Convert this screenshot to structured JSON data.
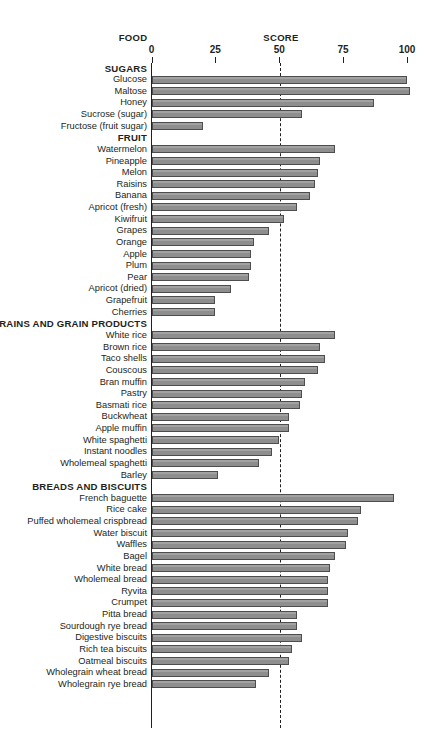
{
  "header": {
    "food": "FOOD",
    "score": "SCORE"
  },
  "axis": {
    "ticks": [
      0,
      25,
      50,
      75,
      100
    ],
    "reference_line": 50
  },
  "chart_data": {
    "type": "bar",
    "title": "",
    "xlabel": "SCORE",
    "ylabel": "FOOD",
    "orientation": "horizontal",
    "xlim": [
      0,
      100
    ],
    "grid": false,
    "reference_line": 50,
    "sections": [
      {
        "name": "SUGARS",
        "items": [
          {
            "label": "Glucose",
            "value": 100
          },
          {
            "label": "Maltose",
            "value": 101
          },
          {
            "label": "Honey",
            "value": 87
          },
          {
            "label": "Sucrose (sugar)",
            "value": 59
          },
          {
            "label": "Fructose (fruit sugar)",
            "value": 20
          }
        ]
      },
      {
        "name": "FRUIT",
        "items": [
          {
            "label": "Watermelon",
            "value": 72
          },
          {
            "label": "Pineapple",
            "value": 66
          },
          {
            "label": "Melon",
            "value": 65
          },
          {
            "label": "Raisins",
            "value": 64
          },
          {
            "label": "Banana",
            "value": 62
          },
          {
            "label": "Apricot (fresh)",
            "value": 57
          },
          {
            "label": "Kiwifruit",
            "value": 52
          },
          {
            "label": "Grapes",
            "value": 46
          },
          {
            "label": "Orange",
            "value": 40
          },
          {
            "label": "Apple",
            "value": 39
          },
          {
            "label": "Plum",
            "value": 39
          },
          {
            "label": "Pear",
            "value": 38
          },
          {
            "label": "Apricot (dried)",
            "value": 31
          },
          {
            "label": "Grapefruit",
            "value": 25
          },
          {
            "label": "Cherries",
            "value": 25
          }
        ]
      },
      {
        "name": "GRAINS AND GRAIN PRODUCTS",
        "items": [
          {
            "label": "White rice",
            "value": 72
          },
          {
            "label": "Brown rice",
            "value": 66
          },
          {
            "label": "Taco shells",
            "value": 68
          },
          {
            "label": "Couscous",
            "value": 65
          },
          {
            "label": "Bran muffin",
            "value": 60
          },
          {
            "label": "Pastry",
            "value": 59
          },
          {
            "label": "Basmati rice",
            "value": 58
          },
          {
            "label": "Buckwheat",
            "value": 54
          },
          {
            "label": "Apple muffin",
            "value": 54
          },
          {
            "label": "White spaghetti",
            "value": 50
          },
          {
            "label": "Instant noodles",
            "value": 47
          },
          {
            "label": "Wholemeal spaghetti",
            "value": 42
          },
          {
            "label": "Barley",
            "value": 26
          }
        ]
      },
      {
        "name": "BREADS AND BISCUITS",
        "items": [
          {
            "label": "French baguette",
            "value": 95
          },
          {
            "label": "Rice cake",
            "value": 82
          },
          {
            "label": "Puffed wholemeal crispbread",
            "value": 81
          },
          {
            "label": "Water biscuit",
            "value": 77
          },
          {
            "label": "Waffles",
            "value": 76
          },
          {
            "label": "Bagel",
            "value": 72
          },
          {
            "label": "White bread",
            "value": 70
          },
          {
            "label": "Wholemeal bread",
            "value": 69
          },
          {
            "label": "Ryvita",
            "value": 69
          },
          {
            "label": "Crumpet",
            "value": 69
          },
          {
            "label": "Pitta bread",
            "value": 57
          },
          {
            "label": "Sourdough rye bread",
            "value": 57
          },
          {
            "label": "Digestive biscuits",
            "value": 59
          },
          {
            "label": "Rich tea biscuits",
            "value": 55
          },
          {
            "label": "Oatmeal biscuits",
            "value": 54
          },
          {
            "label": "Wholegrain wheat bread",
            "value": 46
          },
          {
            "label": "Wholegrain rye bread",
            "value": 41
          }
        ]
      }
    ]
  }
}
